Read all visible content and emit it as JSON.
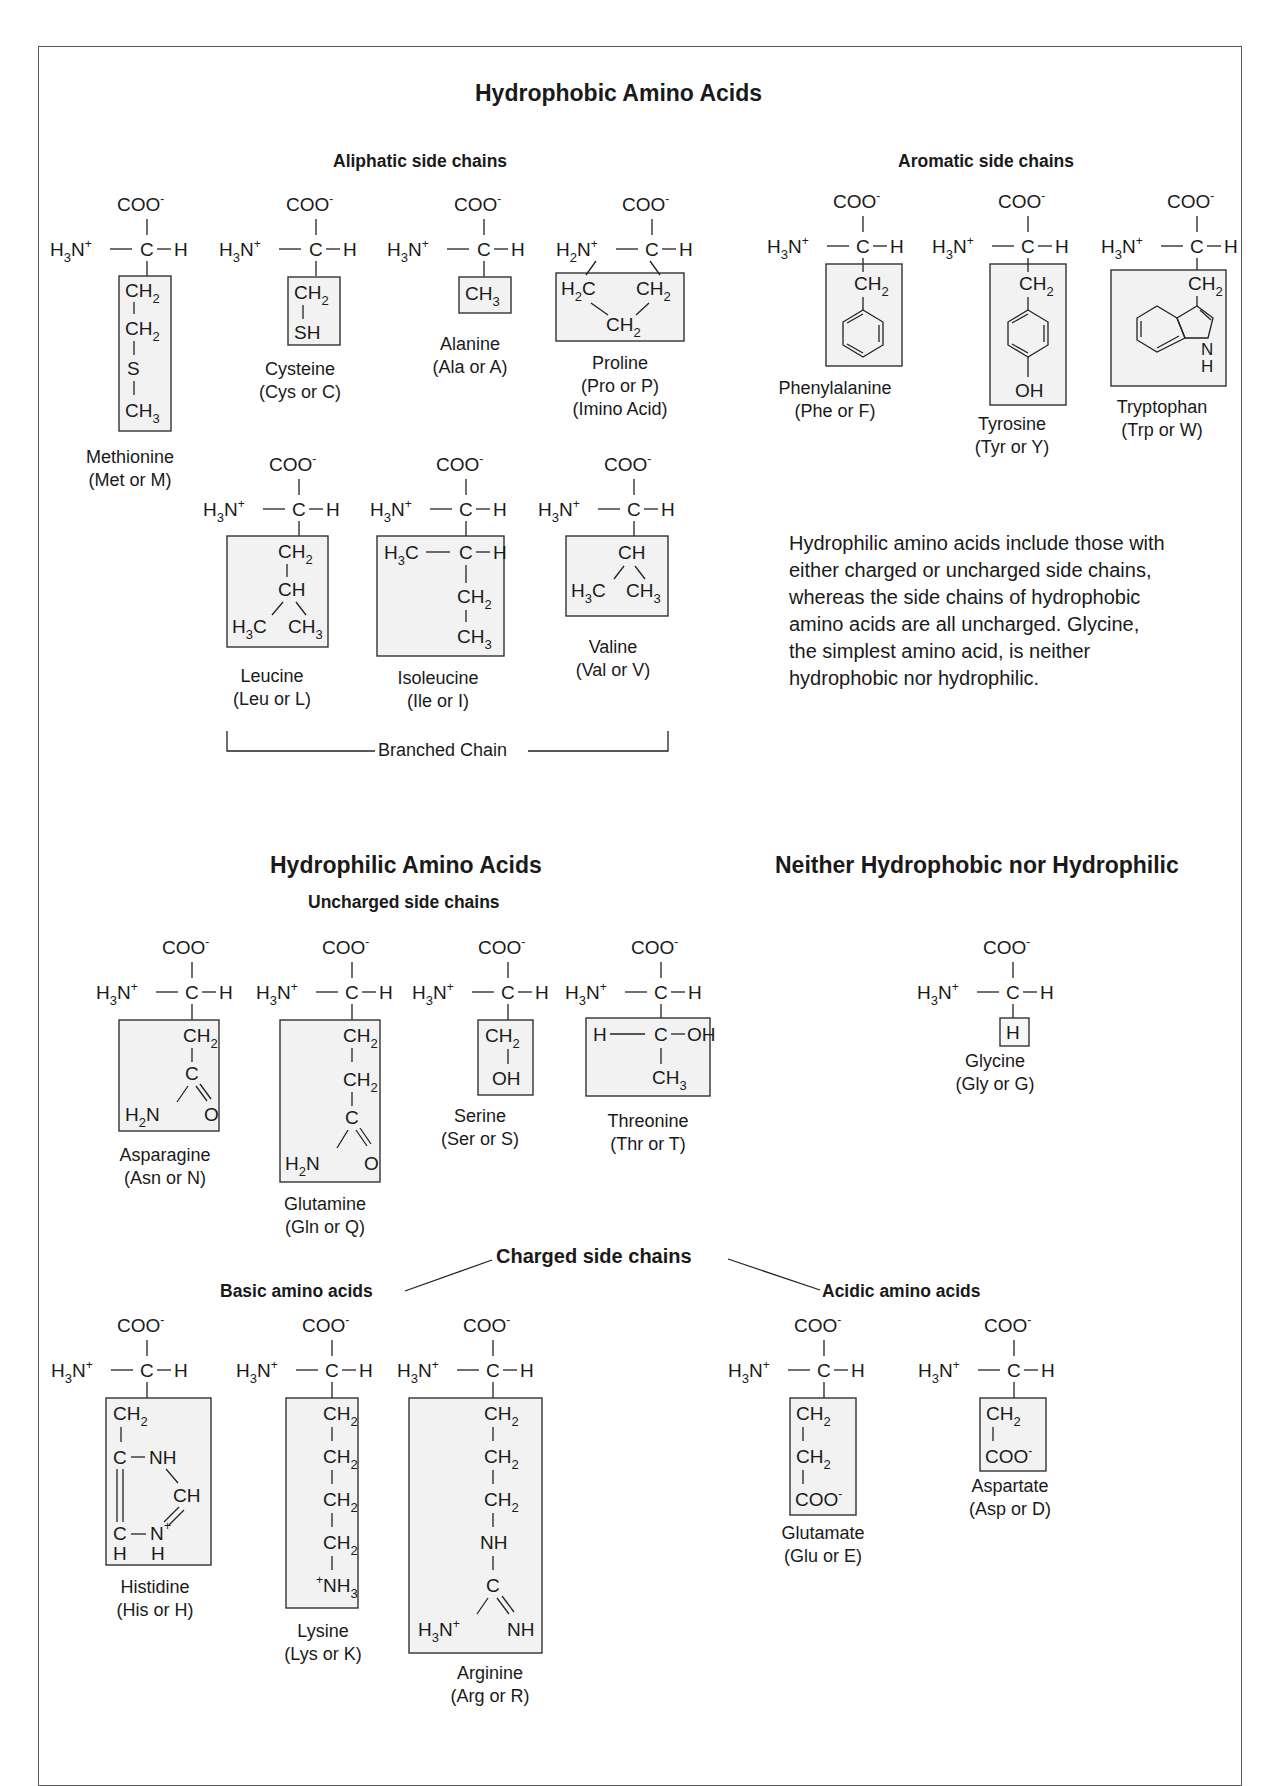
{
  "figure": {
    "sections": {
      "hydrophobic": {
        "title": "Hydrophobic Amino Acids",
        "aliphatic_label": "Aliphatic side chains",
        "aromatic_label": "Aromatic side chains",
        "branched_label": "Branched Chain"
      },
      "hydrophilic": {
        "title": "Hydrophilic Amino Acids",
        "uncharged_label": "Uncharged side chains",
        "charged_label": "Charged side chains",
        "basic_label": "Basic amino acids",
        "acidic_label": "Acidic amino acids"
      },
      "neither": {
        "title": "Neither Hydrophobic nor Hydrophilic"
      }
    },
    "note": "Hydrophilic amino acids include those with either charged or uncharged side chains, whereas the side chains of hydrophobic amino acids are all uncharged. Glycine, the simplest amino acid, is neither hydrophobic nor hydrophilic.",
    "amino_acids": {
      "methionine": {
        "name": "Methionine",
        "abbr": "(Met or M)",
        "category": "hydrophobic-aliphatic",
        "side_chain": [
          "CH2",
          "CH2",
          "S",
          "CH3"
        ]
      },
      "cysteine": {
        "name": "Cysteine",
        "abbr": "(Cys or C)",
        "category": "hydrophobic-aliphatic",
        "side_chain": [
          "CH2",
          "SH"
        ]
      },
      "alanine": {
        "name": "Alanine",
        "abbr": "(Ala or A)",
        "category": "hydrophobic-aliphatic",
        "side_chain": [
          "CH3"
        ]
      },
      "proline": {
        "name": "Proline",
        "abbr": "(Pro or P)",
        "extra": "(Imino Acid)",
        "category": "hydrophobic-aliphatic",
        "side_chain": [
          "H2C",
          "CH2",
          "CH2"
        ]
      },
      "leucine": {
        "name": "Leucine",
        "abbr": "(Leu or L)",
        "category": "hydrophobic-aliphatic-branched",
        "side_chain": [
          "CH2",
          "CH",
          "H3C",
          "CH3"
        ]
      },
      "isoleucine": {
        "name": "Isoleucine",
        "abbr": "(Ile or I)",
        "category": "hydrophobic-aliphatic-branched",
        "side_chain": [
          "H3C-C-H",
          "CH2",
          "CH3"
        ]
      },
      "valine": {
        "name": "Valine",
        "abbr": "(Val or V)",
        "category": "hydrophobic-aliphatic-branched",
        "side_chain": [
          "CH",
          "H3C",
          "CH3"
        ]
      },
      "phenylalanine": {
        "name": "Phenylalanine",
        "abbr": "(Phe or F)",
        "category": "hydrophobic-aromatic",
        "side_chain": [
          "CH2",
          "phenyl"
        ]
      },
      "tyrosine": {
        "name": "Tyrosine",
        "abbr": "(Tyr or Y)",
        "category": "hydrophobic-aromatic",
        "side_chain": [
          "CH2",
          "phenol",
          "OH"
        ]
      },
      "tryptophan": {
        "name": "Tryptophan",
        "abbr": "(Trp or W)",
        "category": "hydrophobic-aromatic",
        "side_chain": [
          "CH2",
          "indole",
          "N",
          "H"
        ]
      },
      "asparagine": {
        "name": "Asparagine",
        "abbr": "(Asn or N)",
        "category": "hydrophilic-uncharged",
        "side_chain": [
          "CH2",
          "C",
          "H2N",
          "O"
        ]
      },
      "glutamine": {
        "name": "Glutamine",
        "abbr": "(Gln or Q)",
        "category": "hydrophilic-uncharged",
        "side_chain": [
          "CH2",
          "CH2",
          "C",
          "H2N",
          "O"
        ]
      },
      "serine": {
        "name": "Serine",
        "abbr": "(Ser or S)",
        "category": "hydrophilic-uncharged",
        "side_chain": [
          "CH2",
          "OH"
        ]
      },
      "threonine": {
        "name": "Threonine",
        "abbr": "(Thr or T)",
        "category": "hydrophilic-uncharged",
        "side_chain": [
          "H-C-OH",
          "CH3"
        ]
      },
      "glycine": {
        "name": "Glycine",
        "abbr": "(Gly or G)",
        "category": "neither",
        "side_chain": [
          "H"
        ]
      },
      "histidine": {
        "name": "Histidine",
        "abbr": "(His or H)",
        "category": "hydrophilic-charged-basic",
        "side_chain": [
          "CH2",
          "C-NH",
          "CH",
          "C-N+",
          "H",
          "H"
        ]
      },
      "lysine": {
        "name": "Lysine",
        "abbr": "(Lys or K)",
        "category": "hydrophilic-charged-basic",
        "side_chain": [
          "CH2",
          "CH2",
          "CH2",
          "CH2",
          "+NH3"
        ]
      },
      "arginine": {
        "name": "Arginine",
        "abbr": "(Arg or R)",
        "category": "hydrophilic-charged-basic",
        "side_chain": [
          "CH2",
          "CH2",
          "CH2",
          "NH",
          "C",
          "H3N+",
          "NH"
        ]
      },
      "glutamate": {
        "name": "Glutamate",
        "abbr": "(Glu or E)",
        "category": "hydrophilic-charged-acidic",
        "side_chain": [
          "CH2",
          "CH2",
          "COO-"
        ]
      },
      "aspartate": {
        "name": "Aspartate",
        "abbr": "(Asp or D)",
        "category": "hydrophilic-charged-acidic",
        "side_chain": [
          "CH2",
          "COO-"
        ]
      }
    },
    "backbone": {
      "carboxyl": "COO",
      "amino": "H",
      "amino_sub": "3",
      "amino_end": "N",
      "alpha_c": "C",
      "alpha_h": "H"
    },
    "colors": {
      "box_fill": "#f2f2f2",
      "box_stroke": "#333333",
      "ink": "#1a1a1a",
      "frame": "#555555"
    }
  }
}
